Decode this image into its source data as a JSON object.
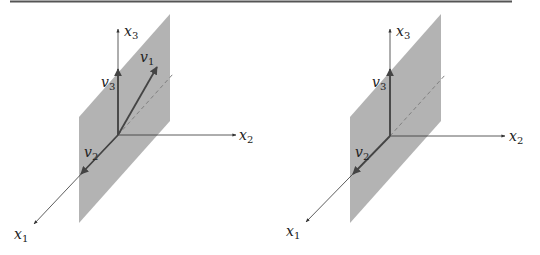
{
  "figure": {
    "rule_color": "#555555",
    "plane_color": "#b3b3b3",
    "vector_color": "#333333",
    "axis_color": "#333333",
    "dash_color": "#808080"
  },
  "left": {
    "axes": {
      "x1": {
        "base": "x",
        "sub": "1"
      },
      "x2": {
        "base": "x",
        "sub": "2"
      },
      "x3": {
        "base": "x",
        "sub": "3"
      }
    },
    "vectors": {
      "v1": {
        "base": "v",
        "sub": "1"
      },
      "v2": {
        "base": "v",
        "sub": "2"
      },
      "v3": {
        "base": "v",
        "sub": "3"
      }
    }
  },
  "right": {
    "axes": {
      "x1": {
        "base": "x",
        "sub": "1"
      },
      "x2": {
        "base": "x",
        "sub": "2"
      },
      "x3": {
        "base": "x",
        "sub": "3"
      }
    },
    "vectors": {
      "v2": {
        "base": "v",
        "sub": "2"
      },
      "v3": {
        "base": "v",
        "sub": "3"
      }
    }
  }
}
